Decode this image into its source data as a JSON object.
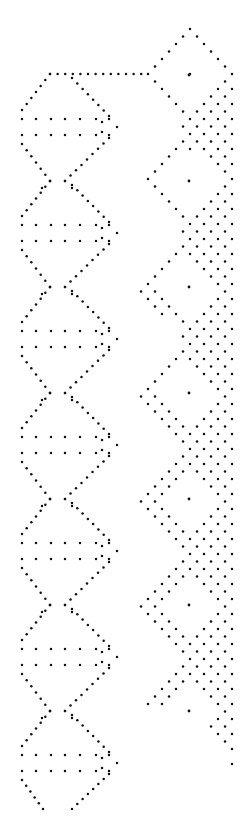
{
  "canvas": {
    "width": 248,
    "height": 839,
    "background": "#ffffff",
    "dot_color": "#111111"
  },
  "pattern": {
    "type": "lace-pricking-dot-pattern",
    "period_y": 106,
    "repeats": 7,
    "left_column": {
      "name": "diamond-chain",
      "first_row_pair_y": [
        119,
        135
      ],
      "row_pair_x": [
        22,
        36,
        51,
        65,
        80,
        96,
        109
      ],
      "tip_x": 117,
      "crossing_y_first": 181,
      "crossing_x": [
        50,
        65
      ],
      "outer_left_x": 22,
      "top_line": {
        "y": 74,
        "x_start": 50,
        "x_end": 142,
        "step": 7.6
      },
      "bottom_end_y": 809,
      "bottom_end_x": [
        43,
        72
      ]
    },
    "right_column": {
      "name": "ground-with-diamonds",
      "first_center": [
        189,
        75
      ],
      "diamond_half_width": 51,
      "diamond_half_height": 53,
      "apex_y": 29,
      "edge_x": 232,
      "lattice": {
        "dx": 7,
        "dy": 7.5
      },
      "last_bottom_tip": [
        231,
        808
      ]
    }
  }
}
